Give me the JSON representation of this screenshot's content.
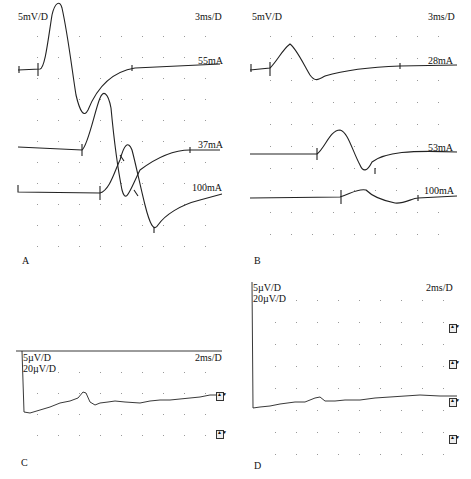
{
  "panels": {
    "A": {
      "label": "A",
      "gain": "5mV/D",
      "sweep": "3ms/D",
      "traces": [
        {
          "label": "55mA"
        },
        {
          "label": "37mA"
        },
        {
          "label": "100mA"
        }
      ]
    },
    "B": {
      "label": "B",
      "gain": "5mV/D",
      "sweep": "3ms/D",
      "traces": [
        {
          "label": "28mA"
        },
        {
          "label": "53mA"
        },
        {
          "label": "100mA"
        }
      ]
    },
    "C": {
      "label": "C",
      "gain1": "5µV/D",
      "gain2": "20µV/D",
      "sweep": "2ms/D"
    },
    "D": {
      "label": "D",
      "gain1": "5µV/D",
      "gain2": "20µV/D",
      "sweep": "2ms/D"
    }
  },
  "colors": {
    "trace": "#222222",
    "grid": "#888888"
  }
}
